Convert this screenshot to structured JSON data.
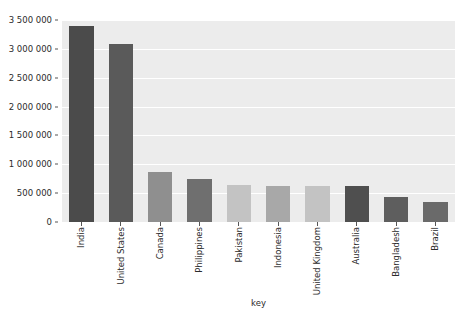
{
  "chart_data": {
    "type": "bar",
    "title": "",
    "xlabel": "key",
    "ylabel": "",
    "grid": true,
    "legend": "none",
    "ylim": [
      0,
      3500000
    ],
    "y_ticks": [
      0,
      500000,
      1000000,
      1500000,
      2000000,
      2500000,
      3000000,
      3500000
    ],
    "y_tick_labels": [
      "0",
      "500 000",
      "1 000 000",
      "1 500 000",
      "2 000 000",
      "2 500 000",
      "3 000 000",
      "3 500 000"
    ],
    "categories": [
      "India",
      "United States",
      "Canada",
      "Philippines",
      "Pakistan",
      "Indonesia",
      "United Kingdom",
      "Australia",
      "Bangladesh",
      "Brazil"
    ],
    "values": [
      3400000,
      3080000,
      870000,
      740000,
      640000,
      630000,
      620000,
      620000,
      430000,
      345000
    ],
    "bar_colors": [
      "#4b4b4b",
      "#5a5a5a",
      "#8f8f8f",
      "#6f6f6f",
      "#c3c3c3",
      "#a8a8a8",
      "#c3c3c3",
      "#4f4f4f",
      "#5e5e5e",
      "#6a6a6a"
    ]
  },
  "figure": {
    "background": "#ffffff",
    "plot_background": "#ececec",
    "gridline_color": "#ffffff"
  }
}
